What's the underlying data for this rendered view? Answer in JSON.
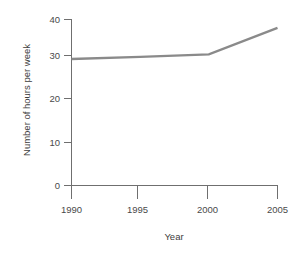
{
  "chart_data": {
    "type": "line",
    "title": "",
    "subtitle": "",
    "xlabel": "Year",
    "ylabel": "Number of hours per week",
    "x": [
      1990,
      1995,
      2000,
      2005
    ],
    "values": [
      30.5,
      31.0,
      31.6,
      38.0
    ],
    "series": [
      {
        "name": "Number of hours per week",
        "values": [
          30.5,
          31.0,
          31.6,
          38.0
        ],
        "color": "#8a8a8a"
      }
    ],
    "xlim": [
      1990,
      2005
    ],
    "ylim": [
      0,
      40
    ],
    "xticks": [
      1990,
      1995,
      2000,
      2005
    ],
    "yticks": [
      0,
      10,
      20,
      30,
      40
    ],
    "xtick_labels": [
      "1990",
      "1995",
      "2000",
      "2005"
    ],
    "ytick_labels": [
      "0",
      "10",
      "20",
      "30",
      "40"
    ],
    "grid": false,
    "legend": false,
    "legend_position": "none",
    "annotations": []
  },
  "axes": {
    "y_tick_0": "0",
    "y_tick_1": "10",
    "y_tick_2": "20",
    "y_tick_3": "30",
    "y_tick_4": "40",
    "x_tick_0": "1990",
    "x_tick_1": "1995",
    "x_tick_2": "2000",
    "x_tick_3": "2005",
    "x_title": "Year",
    "y_title": "Number of hours per week"
  },
  "colors": {
    "line": "#8a8a8a",
    "axis": "#6f6f6f",
    "text": "#3d3d3d",
    "background": "#ffffff"
  }
}
